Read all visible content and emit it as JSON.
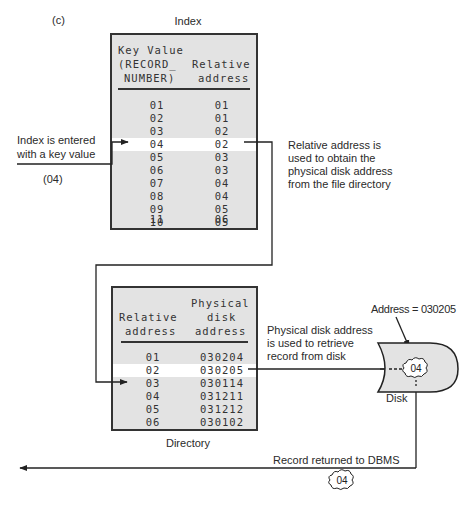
{
  "figure": {
    "panel_label": "(c)",
    "index_title": "Index",
    "directory_title": "Directory",
    "disk_label": "Disk"
  },
  "index_table": {
    "headers": {
      "col1_line1": "Key Value",
      "col1_line2": "(RECORD_",
      "col1_line3": "NUMBER)",
      "col2_line1": "Relative",
      "col2_line2": "address"
    },
    "rows": [
      {
        "key": "01",
        "rel": "01"
      },
      {
        "key": "02",
        "rel": "01"
      },
      {
        "key": "03",
        "rel": "02"
      },
      {
        "key": "04",
        "rel": "02",
        "highlight": true
      },
      {
        "key": "05",
        "rel": "03"
      },
      {
        "key": "06",
        "rel": "03"
      },
      {
        "key": "07",
        "rel": "04"
      },
      {
        "key": "08",
        "rel": "04"
      },
      {
        "key": "09",
        "rel": "05"
      },
      {
        "key": "10",
        "rel": "05"
      },
      {
        "key": "11",
        "rel": "06"
      }
    ]
  },
  "directory_table": {
    "headers": {
      "col1_line1": "Relative",
      "col1_line2": "address",
      "col2_line1": "Physical",
      "col2_line2": "disk",
      "col2_line3": "address"
    },
    "rows": [
      {
        "rel": "01",
        "phys": "030204"
      },
      {
        "rel": "02",
        "phys": "030205",
        "highlight": true
      },
      {
        "rel": "03",
        "phys": "030114"
      },
      {
        "rel": "04",
        "phys": "031211"
      },
      {
        "rel": "05",
        "phys": "031212"
      },
      {
        "rel": "06",
        "phys": "030102"
      }
    ]
  },
  "annotations": {
    "index_entry_line1": "Index is entered",
    "index_entry_line2": "with a key value",
    "index_entry_value": "(04)",
    "relative_note_line1": "Relative address is",
    "relative_note_line2": "used to obtain the",
    "relative_note_line3": "physical disk address",
    "relative_note_line4": "from the file directory",
    "physical_note_line1": "Physical disk address",
    "physical_note_line2": "is used to retrieve",
    "physical_note_line3": "record from disk",
    "disk_address": "Address = 030205",
    "disk_record": "04",
    "returned_note": "Record returned to DBMS",
    "returned_record": "04"
  },
  "colors": {
    "panel_fill": "#e3e3e3",
    "highlight_row": "#ffffff",
    "line": "#222222"
  }
}
